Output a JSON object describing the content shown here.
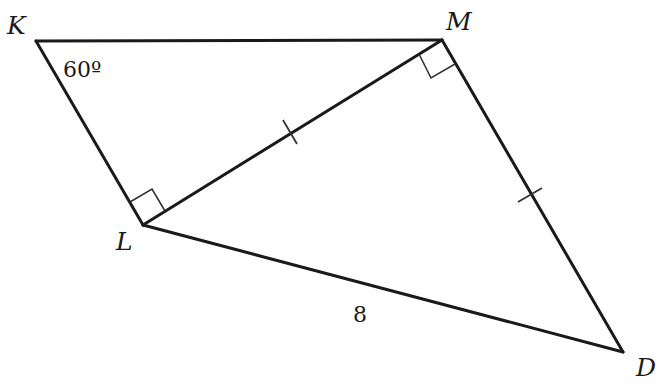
{
  "figure": {
    "type": "geometry",
    "vertices": [
      {
        "name": "K"
      },
      {
        "name": "M"
      },
      {
        "name": "L"
      },
      {
        "name": "D"
      }
    ],
    "segments": [
      "KM",
      "KL",
      "LM",
      "MD",
      "LD"
    ],
    "right_angles": [
      "KLM",
      "LMD"
    ],
    "congruent_marks": [
      "LM",
      "MD"
    ],
    "labels": {
      "K": "K",
      "M": "M",
      "L": "L",
      "D": "D",
      "angle_K": "60º",
      "side_LD": "8"
    }
  }
}
